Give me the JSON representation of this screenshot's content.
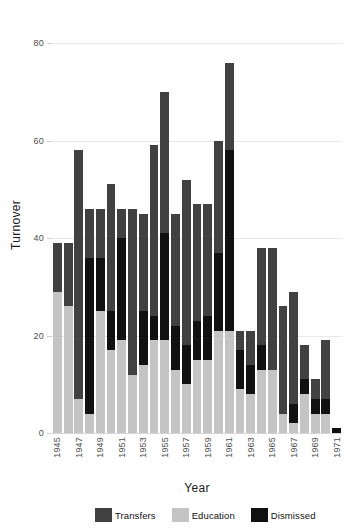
{
  "chart_data": {
    "type": "bar",
    "subtype": "stacked-bar",
    "title": "",
    "xlabel": "Year",
    "ylabel": "Turnover",
    "ylim": [
      0,
      80
    ],
    "yticks": [
      0,
      20,
      40,
      60,
      80
    ],
    "grid": true,
    "legend_position": "bottom",
    "stack_order_bottom_to_top": [
      "Education",
      "Dismissed",
      "Transfers"
    ],
    "categories": [
      "1945",
      "1946",
      "1947",
      "1948",
      "1949",
      "1950",
      "1951",
      "1952",
      "1953",
      "1954",
      "1955",
      "1956",
      "1957",
      "1958",
      "1959",
      "1960",
      "1961",
      "1962",
      "1963",
      "1964",
      "1965",
      "1966",
      "1967",
      "1968",
      "1969",
      "1970",
      "1971"
    ],
    "xtick_labels": [
      "1945",
      "1947",
      "1949",
      "1951",
      "1953",
      "1955",
      "1957",
      "1959",
      "1961",
      "1963",
      "1965",
      "1967",
      "1969",
      "1971"
    ],
    "series": [
      {
        "name": "Education",
        "color": "#c4c4c4",
        "values": [
          29,
          26,
          7,
          4,
          25,
          17,
          19,
          12,
          14,
          19,
          19,
          13,
          10,
          15,
          15,
          21,
          21,
          9,
          8,
          13,
          13,
          4,
          2,
          8,
          4,
          4,
          0
        ]
      },
      {
        "name": "Dismissed",
        "color": "#111111",
        "values": [
          0,
          0,
          0,
          32,
          11,
          8,
          21,
          0,
          11,
          5,
          22,
          9,
          8,
          8,
          9,
          16,
          37,
          8,
          6,
          5,
          0,
          0,
          4,
          3,
          3,
          3,
          1
        ]
      },
      {
        "name": "Transfers",
        "color": "#414141",
        "values": [
          10,
          13,
          51,
          10,
          10,
          26,
          6,
          34,
          20,
          35,
          29,
          23,
          34,
          24,
          23,
          23,
          18,
          4,
          7,
          20,
          25,
          22,
          23,
          7,
          4,
          12,
          0
        ]
      }
    ],
    "totals": [
      39,
      39,
      58,
      46,
      46,
      51,
      46,
      46,
      45,
      59,
      70,
      45,
      52,
      47,
      47,
      60,
      76,
      21,
      21,
      38,
      38,
      26,
      29,
      18,
      11,
      19,
      1
    ]
  },
  "legend": {
    "items": [
      {
        "label": "Transfers",
        "color": "#414141"
      },
      {
        "label": "Education",
        "color": "#c4c4c4"
      },
      {
        "label": "Dismissed",
        "color": "#111111"
      }
    ]
  },
  "axes": {
    "y_title": "Turnover",
    "x_title": "Year"
  }
}
